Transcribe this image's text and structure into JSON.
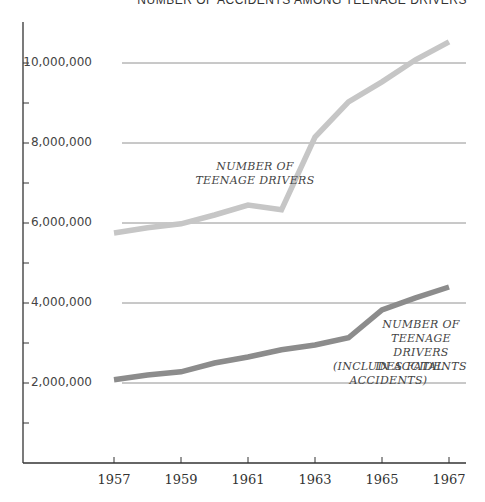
{
  "chart_data": {
    "type": "line",
    "title": "NUMBER OF ACCIDENTS AMONG TEENAGE DRIVERS",
    "xlabel": "",
    "ylabel": "",
    "x": [
      1957,
      1958,
      1959,
      1960,
      1961,
      1962,
      1963,
      1964,
      1965,
      1966,
      1967
    ],
    "x_tick_labels": [
      "1957",
      "1959",
      "1961",
      "1963",
      "1965",
      "1967"
    ],
    "y_tick_labels": [
      "2,000,000",
      "4,000,000",
      "6,000,000",
      "8,000,000",
      "10,000,000"
    ],
    "y_ticks": [
      2000000,
      4000000,
      6000000,
      8000000,
      10000000
    ],
    "ylim": [
      0,
      11000000
    ],
    "grid": true,
    "series": [
      {
        "name": "NUMBER OF TEENAGE DRIVERS",
        "label_lines": [
          "NUMBER OF",
          "TEENAGE DRIVERS"
        ],
        "color": "#c6c6c6",
        "values": [
          5750000,
          5880000,
          5980000,
          6200000,
          6450000,
          6330000,
          8150000,
          9030000,
          9530000,
          10080000,
          10530000
        ]
      },
      {
        "name": "NUMBER OF TEENAGE DRIVERS IN ACCIDENTS (INCLUDES FATAL ACCIDENTS)",
        "label_lines": [
          "NUMBER OF",
          "TEENAGE DRIVERS",
          "IN ACCIDENTS"
        ],
        "note": "(INCLUDES FATAL ACCIDENTS)",
        "color": "#8c8c8c",
        "values": [
          2080000,
          2200000,
          2280000,
          2500000,
          2650000,
          2830000,
          2950000,
          3130000,
          3830000,
          4130000,
          4400000
        ]
      }
    ],
    "legend": "inline labels"
  }
}
